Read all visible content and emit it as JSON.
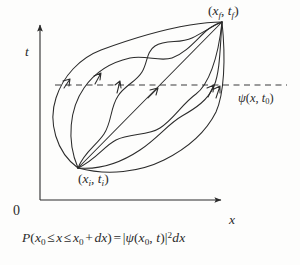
{
  "figure": {
    "background_color": "#fdfdfc",
    "ink_color": "#2b2b2b"
  },
  "axes": {
    "vertical_label": "t",
    "horizontal_label": "x",
    "origin_label": "0"
  },
  "points": {
    "final": {
      "open": "(",
      "var1": "x",
      "sub1": "f",
      "comma": ", ",
      "var2": "t",
      "sub2": "f",
      "close": ")"
    },
    "initial": {
      "open": "(",
      "var1": "x",
      "sub1": "i",
      "comma": ", ",
      "var2": "t",
      "sub2": "i",
      "close": ")"
    }
  },
  "dashed_line": {
    "label_psi": "ψ",
    "label_open": "(",
    "label_var_x": "x",
    "label_comma": ", ",
    "label_var_t": "t",
    "label_sub": "0",
    "label_close": ")"
  },
  "caption": {
    "p": "P",
    "open_paren": "(",
    "x0_var": "x",
    "x0_sub": "0",
    "le1": "≤",
    "x_var": "x",
    "le2": "≤",
    "x0b_var": "x",
    "x0b_sub": "0",
    "plus": "+",
    "dx": "dx",
    "close_paren": ")",
    "equals": "=",
    "abs_open": "|",
    "psi": "ψ",
    "arg_open": "(",
    "arg_x": "x",
    "arg_x_sub": "0",
    "arg_comma": ", ",
    "arg_t": "t",
    "arg_close": ")",
    "abs_close": "|",
    "square": "2",
    "dx_tail": "dx"
  },
  "geometry": {
    "initial_point_px": [
      78,
      168
    ],
    "final_point_px": [
      222,
      22
    ],
    "dashed_line_y_px": 85,
    "dashed_line_x_start_px": 55,
    "dashed_line_x_end_px": 287,
    "axis_vertical_x_px": 40,
    "axis_horizontal_y_px": 200,
    "path_count": 5
  }
}
